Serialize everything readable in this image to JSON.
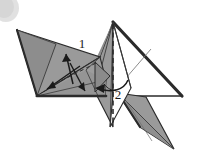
{
  "figure": {
    "name": "origami-fold-diagram",
    "background_color": "#ffffff"
  },
  "palette": {
    "paper_front_gray": "#9a9a9a",
    "paper_shadow_gray": "#8a8a8a",
    "paper_mid_gray": "#a5a5a5",
    "paper_dark_gray": "#7d7d7d",
    "paper_white": "#ffffff",
    "outline_dark": "#2b2b2b",
    "outline_thin": "#3a3a3a",
    "thin_crease": "#6e6e6e",
    "smudge_gray": "#dcdcdc",
    "label_color": "#1a1a1a"
  },
  "labels": [
    {
      "id": "step-1",
      "text": "1",
      "x": 82,
      "y": 48
    },
    {
      "id": "step-2",
      "text": "2",
      "x": 118,
      "y": 99
    }
  ],
  "annotations": {
    "step_1_arrow": "straight-fold-arrow-up-left",
    "step_2_arrow": "curved-fold-arrow-left",
    "dashed_fold_line": "vertical-valley-fold-at-center",
    "extra_arrows": "straight-fold-arrows-on-left-wing"
  },
  "artifacts": {
    "scan_smudge": "light-gray-ellipse-top-left-corner"
  }
}
